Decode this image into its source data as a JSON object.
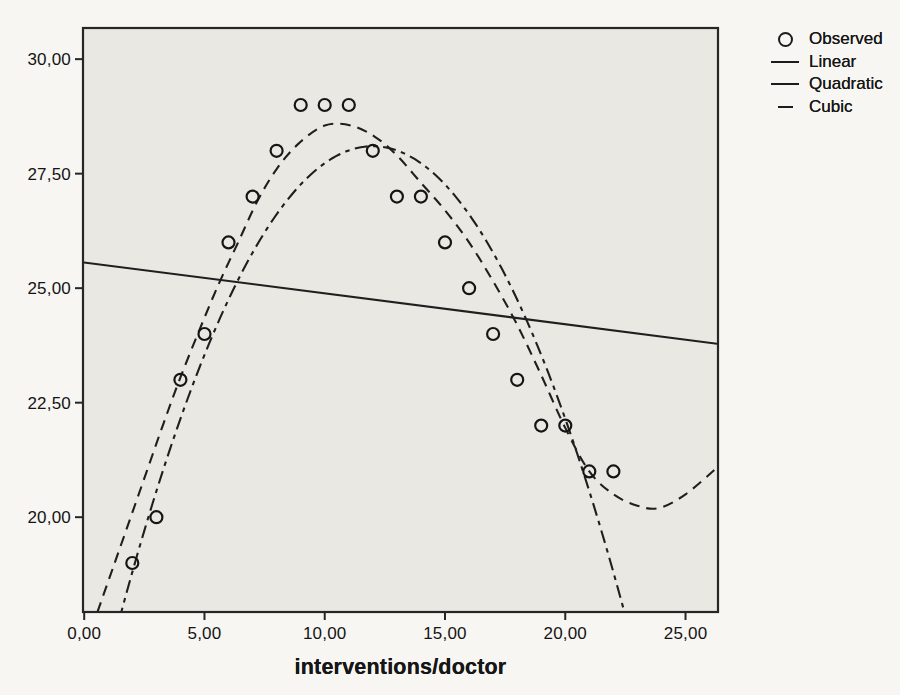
{
  "colors": {
    "ink": "#1f1f1f",
    "plot_background": "#e9e8e2",
    "page_background": "#f7f6f2"
  },
  "chart_data": {
    "type": "scatter",
    "title": "",
    "xlabel": "interventions/doctor",
    "ylabel": "",
    "grid": false,
    "legend_position": "top-right",
    "xlim": [
      -0.05,
      26.35
    ],
    "ylim": [
      17.93,
      30.68
    ],
    "x_tick_values": [
      0,
      5,
      10,
      15,
      20,
      25
    ],
    "x_tick_labels": [
      "0,00",
      "5,00",
      "10,00",
      "15,00",
      "20,00",
      "25,00"
    ],
    "y_tick_values": [
      20,
      22.5,
      25,
      27.5,
      30
    ],
    "y_tick_labels": [
      "20,00",
      "22,50",
      "25,00",
      "27,50",
      "30,00"
    ],
    "series": [
      {
        "name": "Observed",
        "kind": "scatter",
        "marker": "open-circle",
        "points": [
          [
            2,
            19
          ],
          [
            3,
            20
          ],
          [
            4,
            23
          ],
          [
            5,
            24
          ],
          [
            6,
            26
          ],
          [
            7,
            27
          ],
          [
            8,
            28
          ],
          [
            9,
            29
          ],
          [
            10,
            29
          ],
          [
            11,
            29
          ],
          [
            12,
            28
          ],
          [
            13,
            27
          ],
          [
            14,
            27
          ],
          [
            15,
            26
          ],
          [
            16,
            25
          ],
          [
            17,
            24
          ],
          [
            18,
            23
          ],
          [
            19,
            22
          ],
          [
            20,
            22
          ],
          [
            21,
            21
          ],
          [
            22,
            21
          ]
        ]
      },
      {
        "name": "Linear",
        "kind": "line",
        "style": "solid",
        "intercept": 25.56,
        "slope": -0.0674
      },
      {
        "name": "Quadratic",
        "kind": "line",
        "style": "dash-dot",
        "vertex": [
          12,
          28.1
        ],
        "a": -0.093
      },
      {
        "name": "Cubic",
        "kind": "line",
        "style": "long-dash",
        "path_points": [
          [
            0.55,
            17.93
          ],
          [
            1.2,
            18.9
          ],
          [
            1.9,
            19.95
          ],
          [
            2.6,
            21.0
          ],
          [
            3.3,
            22.05
          ],
          [
            4.0,
            23.05
          ],
          [
            4.8,
            24.1
          ],
          [
            5.6,
            25.1
          ],
          [
            6.4,
            26.0
          ],
          [
            7.2,
            26.9
          ],
          [
            8.0,
            27.6
          ],
          [
            8.9,
            28.15
          ],
          [
            10,
            28.55
          ],
          [
            11.1,
            28.55
          ],
          [
            12.1,
            28.3
          ],
          [
            13,
            27.9
          ],
          [
            14,
            27.3
          ],
          [
            15,
            26.7
          ],
          [
            16,
            26.0
          ],
          [
            17,
            25.15
          ],
          [
            18,
            24.2
          ],
          [
            19,
            23.1
          ],
          [
            20,
            21.95
          ],
          [
            21,
            21.0
          ],
          [
            22,
            20.5
          ],
          [
            23,
            20.25
          ],
          [
            23.9,
            20.2
          ],
          [
            25,
            20.5
          ],
          [
            26.35,
            21.1
          ]
        ]
      }
    ],
    "legend": [
      {
        "label": "Observed",
        "marker": "open-circle"
      },
      {
        "label": "Linear",
        "marker": "solid-line"
      },
      {
        "label": "Quadratic",
        "marker": "solid-line"
      },
      {
        "label": "Cubic",
        "marker": "short-dash"
      }
    ]
  }
}
